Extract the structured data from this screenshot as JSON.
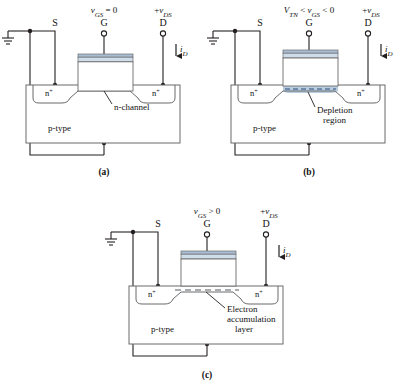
{
  "figure": {
    "colors": {
      "wire": "#231f20",
      "outline": "#6b6b6b",
      "gate_metal": "#c3d2e4",
      "gate_oxide": "#e8edf4",
      "gate_top_band": "#a9bdd4",
      "depletion_fill": "#b9cde1",
      "dash": "#2b4a7a",
      "background": "#ffffff"
    },
    "panels": [
      {
        "id": "a",
        "caption": "(a)",
        "gate_bias": "v_GS = 0",
        "gate_bias_parts": {
          "var": "v",
          "sub": "GS",
          "rest": " = 0"
        },
        "drain_bias": "+v_DS",
        "terminals": {
          "source": "S",
          "gate": "G",
          "drain": "D"
        },
        "current": "i_D",
        "regions": {
          "source_well": "n+",
          "drain_well": "n+",
          "substrate": "p-type"
        },
        "callout": "n-channel",
        "has_depletion_fill": false,
        "has_dashed_layer": false
      },
      {
        "id": "b",
        "caption": "(b)",
        "gate_bias": "V_TN < v_GS < 0",
        "gate_bias_parts": {
          "v1": "V",
          "sub1": "TN",
          "mid": " < ",
          "v2": "v",
          "sub2": "GS",
          "rest": " < 0"
        },
        "drain_bias": "+v_DS",
        "terminals": {
          "source": "S",
          "gate": "G",
          "drain": "D"
        },
        "current": "i_D",
        "regions": {
          "source_well": "n+",
          "drain_well": "n+",
          "substrate": "p-type"
        },
        "callout": "Depletion region",
        "callout_line1": "Depletion",
        "callout_line2": "region",
        "has_depletion_fill": true,
        "has_dashed_layer": true
      },
      {
        "id": "c",
        "caption": "(c)",
        "gate_bias": "v_GS > 0",
        "gate_bias_parts": {
          "var": "v",
          "sub": "GS",
          "rest": " > 0"
        },
        "drain_bias": "+v_DS",
        "terminals": {
          "source": "S",
          "gate": "G",
          "drain": "D"
        },
        "current": "i_D",
        "regions": {
          "source_well": "n+",
          "drain_well": "n+",
          "substrate": "p-type"
        },
        "callout": "Electron accumulation layer",
        "callout_line1": "Electron",
        "callout_line2": "accumulation",
        "callout_line3": "layer",
        "has_depletion_fill": false,
        "has_dashed_layer": true
      }
    ],
    "symbols": {
      "ground": "ground-symbol",
      "node_dot": "junction-dot",
      "open_terminal": "open-terminal-circle",
      "current_arrow": "current-arrow-down"
    }
  }
}
